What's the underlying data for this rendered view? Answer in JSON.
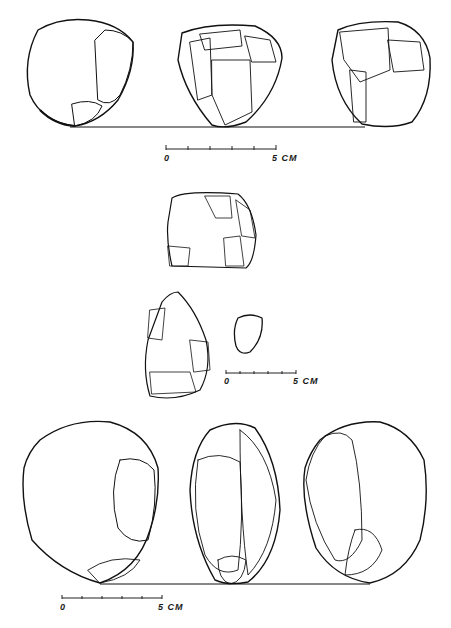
{
  "plate": {
    "groups": [
      {
        "name": "top-row",
        "artifact_count": 3,
        "scale": {
          "start_label": "0",
          "end_label": "5 CM"
        }
      },
      {
        "name": "middle-group",
        "artifact_count": 3,
        "scale": {
          "start_label": "0",
          "end_label": "5 CM"
        }
      },
      {
        "name": "bottom-row",
        "artifact_count": 3,
        "scale": {
          "start_label": "0",
          "end_label": "5 CM"
        }
      }
    ],
    "colors": {
      "ink": "#111111",
      "paper": "#ffffff"
    }
  }
}
